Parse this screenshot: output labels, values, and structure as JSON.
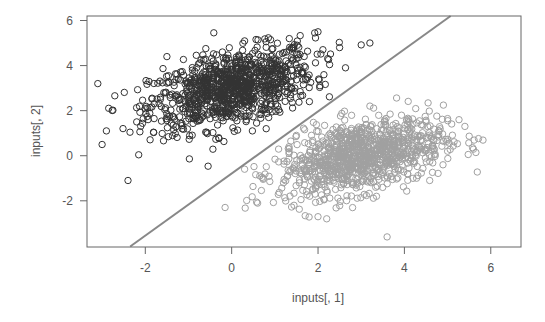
{
  "chart_data": {
    "type": "scatter",
    "title": "",
    "xlabel": "inputs[, 1]",
    "ylabel": "inputs[, 2]",
    "xlim": [
      -3.35,
      6.7
    ],
    "ylim": [
      -4.05,
      6.2
    ],
    "xticks": [
      -2,
      0,
      2,
      4,
      6
    ],
    "yticks": [
      -2,
      0,
      2,
      4,
      6
    ],
    "grid": false,
    "legend": null,
    "series": [
      {
        "name": "class 1 (dark)",
        "color": "#333333",
        "marker": "open-circle",
        "approx_n": 1000,
        "center": [
          0.0,
          3.0
        ],
        "spread": [
          0.95,
          0.9
        ],
        "correlation": 0.45,
        "sample_points": [
          [
            -3.1,
            3.2
          ],
          [
            -3.0,
            0.5
          ],
          [
            -2.9,
            1.1
          ],
          [
            -2.4,
            -1.1
          ],
          [
            -2.2,
            1.5
          ],
          [
            -1.5,
            4.4
          ],
          [
            -1.0,
            2.6
          ],
          [
            -0.5,
            3.2
          ],
          [
            0.0,
            3.0
          ],
          [
            0.5,
            3.5
          ],
          [
            1.0,
            3.7
          ],
          [
            1.5,
            4.5
          ],
          [
            2.0,
            5.5
          ],
          [
            2.5,
            4.8
          ],
          [
            3.2,
            5.0
          ],
          [
            0.8,
            1.2
          ],
          [
            -0.3,
            0.8
          ],
          [
            1.8,
            2.4
          ]
        ]
      },
      {
        "name": "class 2 (light)",
        "color": "#a0a0a0",
        "marker": "open-circle",
        "approx_n": 1000,
        "center": [
          3.0,
          0.0
        ],
        "spread": [
          0.95,
          0.85
        ],
        "correlation": 0.4,
        "sample_points": [
          [
            0.3,
            -0.6
          ],
          [
            0.6,
            -2.1
          ],
          [
            1.2,
            -1.2
          ],
          [
            1.8,
            -0.2
          ],
          [
            2.5,
            0.3
          ],
          [
            3.0,
            0.0
          ],
          [
            3.5,
            0.6
          ],
          [
            4.0,
            1.2
          ],
          [
            4.5,
            1.5
          ],
          [
            5.4,
            1.3
          ],
          [
            3.6,
            -3.6
          ],
          [
            2.2,
            -2.8
          ],
          [
            2.8,
            -2.3
          ],
          [
            4.2,
            -1.0
          ],
          [
            3.2,
            2.2
          ],
          [
            1.5,
            0.9
          ],
          [
            5.0,
            0.2
          ]
        ]
      }
    ],
    "decision_boundary": {
      "type": "line",
      "color": "#888888",
      "points": [
        [
          -2.35,
          -4.03
        ],
        [
          5.07,
          6.2
        ]
      ],
      "slope": 1.38,
      "intercept": -0.78
    }
  },
  "axes": {
    "x_tick_labels": [
      "-2",
      "0",
      "2",
      "4",
      "6"
    ],
    "y_tick_labels": [
      "-2",
      "0",
      "2",
      "4",
      "6"
    ],
    "x_title": "inputs[, 1]",
    "y_title": "inputs[, 2]"
  }
}
